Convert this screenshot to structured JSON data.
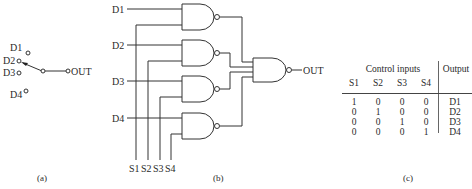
{
  "panel_a": {
    "inputs": [
      "D1",
      "D2",
      "D3",
      "D4"
    ],
    "output": "OUT",
    "caption": "(a)"
  },
  "panel_b": {
    "inputs": [
      "D1",
      "D2",
      "D3",
      "D4"
    ],
    "selects": [
      "S1",
      "S2",
      "S3",
      "S4"
    ],
    "output": "OUT",
    "caption": "(b)"
  },
  "panel_c": {
    "header_control": "Control inputs",
    "header_output": "Output",
    "columns": [
      "S1",
      "S2",
      "S3",
      "S4"
    ],
    "rows": [
      {
        "s": [
          "1",
          "0",
          "0",
          "0"
        ],
        "out": "D1"
      },
      {
        "s": [
          "0",
          "1",
          "0",
          "0"
        ],
        "out": "D2"
      },
      {
        "s": [
          "0",
          "0",
          "1",
          "0"
        ],
        "out": "D3"
      },
      {
        "s": [
          "0",
          "0",
          "0",
          "1"
        ],
        "out": "D4"
      }
    ],
    "caption": "(c)"
  }
}
